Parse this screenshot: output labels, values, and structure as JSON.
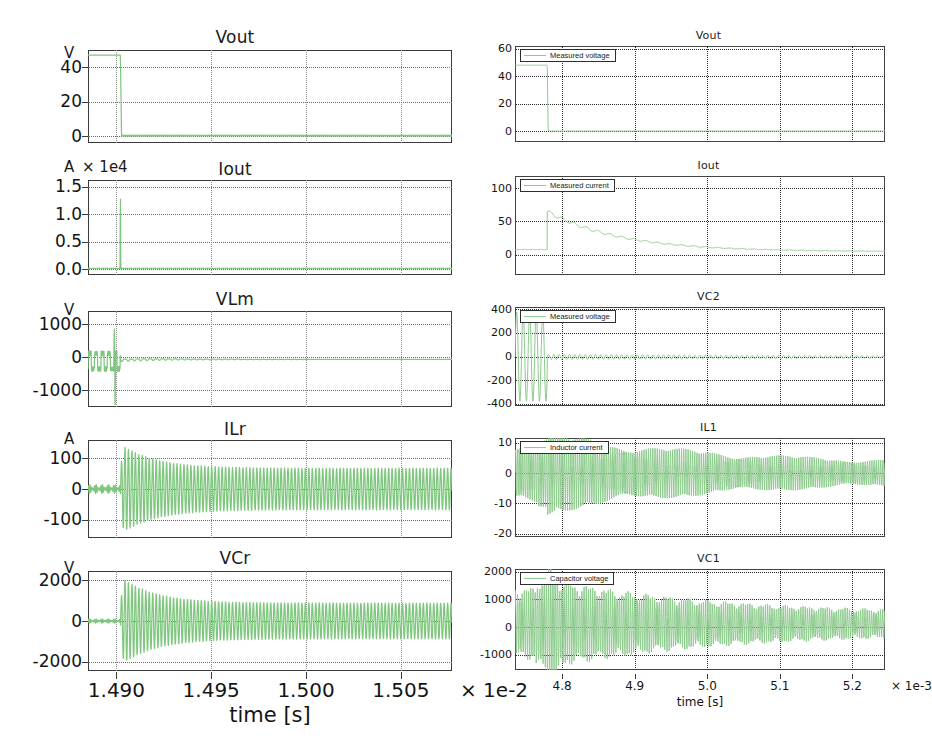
{
  "figure": {
    "columns": [
      {
        "id": "left-column",
        "axis": {
          "xlabel": "time [s]",
          "xticks": [
            "1.490",
            "1.495",
            "1.500",
            "1.505"
          ],
          "xsuffix": "× 1e-2",
          "xmin": 1.4885,
          "xmax": 1.5077,
          "xtick_values": [
            1.49,
            1.495,
            1.5,
            1.505
          ]
        },
        "plots": [
          {
            "title": "Vout",
            "unit": "V",
            "unit_extra": "",
            "yticks": [
              "40",
              "20",
              "0"
            ],
            "ytick_values": [
              40,
              20,
              0
            ],
            "ymin": -4,
            "ymax": 50,
            "legend": null
          },
          {
            "title": "Iout",
            "unit": "A",
            "unit_extra": "× 1e4",
            "yticks": [
              "1.5",
              "1.0",
              "0.5",
              "0.0"
            ],
            "ytick_values": [
              1.5,
              1.0,
              0.5,
              0.0
            ],
            "ymin": -0.1,
            "ymax": 1.62,
            "legend": null
          },
          {
            "title": "VLm",
            "unit": "V",
            "unit_extra": "",
            "yticks": [
              "1000",
              "0",
              "-1000"
            ],
            "ytick_values": [
              1000,
              0,
              -1000
            ],
            "ymin": -1500,
            "ymax": 1400,
            "legend": null
          },
          {
            "title": "ILr",
            "unit": "A",
            "unit_extra": "",
            "yticks": [
              "100",
              "0",
              "-100"
            ],
            "ytick_values": [
              100,
              0,
              -100
            ],
            "ymin": -160,
            "ymax": 160,
            "legend": null
          },
          {
            "title": "VCr",
            "unit": "V",
            "unit_extra": "",
            "yticks": [
              "2000",
              "0",
              "-2000"
            ],
            "ytick_values": [
              2000,
              0,
              -2000
            ],
            "ymin": -2450,
            "ymax": 2450,
            "legend": null
          }
        ]
      },
      {
        "id": "right-column",
        "axis": {
          "xlabel": "time [s]",
          "xticks": [
            "4.8",
            "4.9",
            "5.0",
            "5.1",
            "5.2"
          ],
          "xsuffix": "× 1e-3",
          "xmin": 4.735,
          "xmax": 5.245,
          "xtick_values": [
            4.8,
            4.9,
            5.0,
            5.1,
            5.2
          ]
        },
        "plots": [
          {
            "title": "Vout",
            "unit": "",
            "unit_extra": "",
            "yticks": [
              "60",
              "40",
              "20",
              "0"
            ],
            "ytick_values": [
              60,
              40,
              20,
              0
            ],
            "ymin": -8,
            "ymax": 62,
            "legend": "Measured voltage"
          },
          {
            "title": "Iout",
            "unit": "",
            "unit_extra": "",
            "yticks": [
              "100",
              "50",
              "0"
            ],
            "ytick_values": [
              100,
              50,
              0
            ],
            "ymin": -30,
            "ymax": 118,
            "legend": "Measured current"
          },
          {
            "title": "VC2",
            "unit": "",
            "unit_extra": "",
            "yticks": [
              "400",
              "200",
              "0",
              "-200",
              "-400"
            ],
            "ytick_values": [
              400,
              200,
              0,
              -200,
              -400
            ],
            "ymin": -420,
            "ymax": 420,
            "legend": "Measured voltage"
          },
          {
            "title": "IL1",
            "unit": "",
            "unit_extra": "",
            "yticks": [
              "10",
              "0",
              "-10",
              "-20"
            ],
            "ytick_values": [
              10,
              0,
              -10,
              -20
            ],
            "ymin": -21,
            "ymax": 11.5,
            "legend": "Inductor current"
          },
          {
            "title": "VC1",
            "unit": "",
            "unit_extra": "",
            "yticks": [
              "2000",
              "1000",
              "0",
              "-1000"
            ],
            "ytick_values": [
              2000,
              1000,
              0,
              -1000
            ],
            "ymin": -1550,
            "ymax": 2100,
            "legend": "Capacitor voltage"
          }
        ]
      }
    ],
    "colors": {
      "trace": "#7fc77f",
      "frame": "#3a3a3a",
      "grid": "#6b6b6b",
      "text": "#141414",
      "background": "#ffffff"
    }
  },
  "chart_data": [
    {
      "type": "line",
      "title": "Vout",
      "column": "left",
      "xlabel": "time [s]",
      "ylabel": "V",
      "xlim": [
        0.014885,
        0.015077
      ],
      "ylim": [
        -4,
        50
      ],
      "xtick_labels": [
        "1.490",
        "1.495",
        "1.500",
        "1.505"
      ],
      "x_multiplier": "1e-2",
      "ytick_labels": [
        "40",
        "20",
        "0"
      ],
      "grid": true,
      "legend": null,
      "series": [
        {
          "name": "Vout",
          "description": "Step down from ~47 V to ~0 V at t = 1.4902e-2 s, then flat near 0 V",
          "x": [
            1.4885,
            1.49,
            1.4901,
            1.4902,
            1.4903,
            1.491,
            1.495,
            1.5,
            1.505,
            1.5077
          ],
          "y": [
            47,
            47,
            47,
            25,
            0.6,
            0.4,
            0.3,
            0.25,
            0.2,
            0.2
          ]
        }
      ]
    },
    {
      "type": "line",
      "title": "Iout",
      "column": "left",
      "xlabel": "time [s]",
      "ylabel": "A",
      "y_multiplier": "1e4",
      "xlim": [
        0.014885,
        0.015077
      ],
      "ylim": [
        -0.1,
        1.62
      ],
      "xtick_labels": [
        "1.490",
        "1.495",
        "1.500",
        "1.505"
      ],
      "ytick_labels": [
        "1.5",
        "1.0",
        "0.5",
        "0.0"
      ],
      "grid": true,
      "legend": null,
      "series": [
        {
          "name": "Iout",
          "description": "Near zero, single narrow spike to 1.55e4 A at t = 1.4902e-2 s",
          "x": [
            1.4885,
            1.4899,
            1.49015,
            1.4902,
            1.49025,
            1.4905,
            1.495,
            1.5077
          ],
          "y": [
            0.0,
            0.0,
            0.0,
            1.55,
            0.05,
            0.02,
            0.02,
            0.02
          ]
        }
      ]
    },
    {
      "type": "line",
      "title": "VLm",
      "column": "left",
      "xlabel": "time [s]",
      "ylabel": "V",
      "xlim": [
        0.014885,
        0.015077
      ],
      "ylim": [
        -1500,
        1400
      ],
      "xtick_labels": [
        "1.490",
        "1.495",
        "1.500",
        "1.505"
      ],
      "ytick_labels": [
        "1000",
        "0",
        "-1000"
      ],
      "grid": true,
      "legend": null,
      "series": [
        {
          "name": "VLm",
          "description": "Square-ish ripple between +150 and -400 V before t=1.4902e-2, spike +980/-1400 at the transient, then small ripple around -60 V",
          "peak_positive": 980,
          "peak_negative": -1400,
          "settled_value": -60
        }
      ]
    },
    {
      "type": "line",
      "title": "ILr",
      "column": "left",
      "xlabel": "time [s]",
      "ylabel": "A",
      "xlim": [
        0.014885,
        0.015077
      ],
      "ylim": [
        -160,
        160
      ],
      "xtick_labels": [
        "1.490",
        "1.495",
        "1.500",
        "1.505"
      ],
      "ytick_labels": [
        "100",
        "0",
        "-100"
      ],
      "grid": true,
      "legend": null,
      "series": [
        {
          "name": "ILr",
          "description": "Small oscillation (~±15 A) until 1.4902e-2 s, then resonant burst peaking ~±140 A near 1.4930e-2 s, slowly decaying to ~±70 A by 1.5077e-2 s",
          "envelope_peak": 140,
          "envelope_final": 70,
          "oscillation_frequency_hz": 100000
        }
      ]
    },
    {
      "type": "line",
      "title": "VCr",
      "column": "left",
      "xlabel": "time [s]",
      "ylabel": "V",
      "xlim": [
        0.014885,
        0.015077
      ],
      "ylim": [
        -2450,
        2450
      ],
      "xtick_labels": [
        "1.490",
        "1.495",
        "1.500",
        "1.505"
      ],
      "x_multiplier": "1e-2",
      "ytick_labels": [
        "2000",
        "0",
        "-2000"
      ],
      "grid": true,
      "legend": null,
      "series": [
        {
          "name": "VCr",
          "description": "Small ripple (~±120 V) until 1.4902e-2 s, then resonant burst peaking ~±2050 V near 1.4930e-2 s, decaying to ~±900 V",
          "envelope_peak": 2050,
          "envelope_final": 900
        }
      ]
    },
    {
      "type": "line",
      "title": "Vout",
      "column": "right",
      "xlabel": "time [s]",
      "xlim": [
        0.004735,
        0.005245
      ],
      "ylim": [
        -8,
        62
      ],
      "xtick_labels": [
        "4.8",
        "4.9",
        "5.0",
        "5.1",
        "5.2"
      ],
      "x_multiplier": "1e-3",
      "ytick_labels": [
        "60",
        "40",
        "20",
        "0"
      ],
      "grid": true,
      "legend": {
        "position": "top-left",
        "entries": [
          "Measured voltage"
        ]
      },
      "series": [
        {
          "name": "Measured voltage",
          "description": "Holds ~48 V until t = 4.7795e-3 s then drops to 0 V and stays near 0",
          "x": [
            4.735,
            4.778,
            4.779,
            4.78,
            4.79,
            4.9,
            5.0,
            5.1,
            5.245
          ],
          "y": [
            48,
            48,
            30,
            0,
            0,
            0,
            0,
            0,
            0
          ]
        }
      ]
    },
    {
      "type": "line",
      "title": "Iout",
      "column": "right",
      "xlabel": "time [s]",
      "xlim": [
        0.004735,
        0.005245
      ],
      "ylim": [
        -30,
        118
      ],
      "xtick_labels": [
        "4.8",
        "4.9",
        "5.0",
        "5.1",
        "5.2"
      ],
      "ytick_labels": [
        "100",
        "50",
        "0"
      ],
      "grid": true,
      "legend": {
        "position": "top-left",
        "entries": [
          "Measured current"
        ]
      },
      "series": [
        {
          "name": "Measured current",
          "description": "Flat ~8 A, steps up to ~65 A at 4.7795e-3 s then decays exponentially with small ripple toward ~5 A",
          "x": [
            4.735,
            4.778,
            4.78,
            4.8,
            4.83,
            4.86,
            4.9,
            4.95,
            5.0,
            5.06,
            5.12,
            5.18,
            5.245
          ],
          "y": [
            8,
            8,
            65,
            48,
            33,
            26,
            19,
            15,
            13,
            11,
            9,
            8,
            6
          ]
        }
      ]
    },
    {
      "type": "line",
      "title": "VC2",
      "column": "right",
      "xlabel": "time [s]",
      "xlim": [
        0.004735,
        0.005245
      ],
      "ylim": [
        -420,
        420
      ],
      "xtick_labels": [
        "4.8",
        "4.9",
        "5.0",
        "5.1",
        "5.2"
      ],
      "ytick_labels": [
        "400",
        "200",
        "0",
        "-200",
        "-400"
      ],
      "grid": true,
      "legend": {
        "position": "top-left",
        "entries": [
          "Measured voltage"
        ]
      },
      "series": [
        {
          "name": "Measured voltage",
          "description": "Large oscillation ±380 V from 4.74e-3 to 4.78e-3 s, then collapses to small ripple about 0 V (±25 V)",
          "burst_amplitude": 380,
          "settled_ripple": 25
        }
      ]
    },
    {
      "type": "line",
      "title": "IL1",
      "column": "right",
      "xlabel": "time [s]",
      "xlim": [
        0.004735,
        0.005245
      ],
      "ylim": [
        -21,
        11.5
      ],
      "xtick_labels": [
        "4.8",
        "4.9",
        "5.0",
        "5.1",
        "5.2"
      ],
      "ytick_labels": [
        "10",
        "0",
        "-10",
        "-20"
      ],
      "grid": true,
      "legend": {
        "position": "top-left",
        "entries": [
          "Inductor current"
        ]
      },
      "series": [
        {
          "name": "Inductor current",
          "description": "High-frequency oscillation, amplitude ~9 A early (4.74-4.80e-3 s), decaying to ~2.5 A by 5.2e-3 s",
          "amplitude_start": 9,
          "amplitude_end": 2.5
        }
      ]
    },
    {
      "type": "line",
      "title": "VC1",
      "column": "right",
      "xlabel": "time [s]",
      "xlim": [
        0.004735,
        0.005245
      ],
      "ylim": [
        -1550,
        2100
      ],
      "xtick_labels": [
        "4.8",
        "4.9",
        "5.0",
        "5.1",
        "5.2"
      ],
      "x_multiplier": "1e-3",
      "ytick_labels": [
        "2000",
        "1000",
        "0",
        "-1000"
      ],
      "grid": true,
      "legend": {
        "position": "top-left",
        "entries": [
          "Capacitor voltage"
        ]
      },
      "series": [
        {
          "name": "Capacitor voltage",
          "description": "High-frequency oscillation about 0 V, amplitude ~1150 V early, peaks ~1500 V near 4.79e-3 s, decaying to ~350 V by 5.2e-3 s",
          "amplitude_start": 1150,
          "amplitude_peak": 1500,
          "amplitude_end": 350
        }
      ]
    }
  ]
}
